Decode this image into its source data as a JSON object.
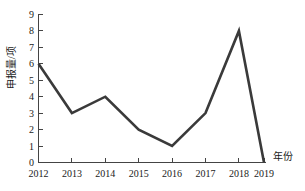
{
  "chart_data": {
    "type": "line",
    "title": "",
    "xlabel": "年份",
    "ylabel": "申报量/项",
    "categories": [
      "2012",
      "2013",
      "2014",
      "2015",
      "2016",
      "2017",
      "2018",
      "2019"
    ],
    "values": [
      6,
      3,
      4,
      2,
      1,
      3,
      8,
      0
    ],
    "series": [
      {
        "name": "申报量",
        "values": [
          6,
          3,
          4,
          2,
          1,
          3,
          8,
          0
        ],
        "color": "#3a3a3a"
      }
    ],
    "x": [
      2012,
      2013,
      2014,
      2015,
      2016,
      2017,
      2018,
      2019
    ],
    "ylim": [
      0,
      9
    ],
    "ytick_labels": [
      "0",
      "1",
      "2",
      "3",
      "4",
      "5",
      "6",
      "7",
      "8",
      "9"
    ],
    "ytick_values": [
      0,
      1,
      2,
      3,
      4,
      5,
      6,
      7,
      8,
      9
    ],
    "xtick_labels": [
      "2012",
      "2013",
      "2014",
      "2015",
      "2016",
      "2017",
      "2018",
      "2019"
    ],
    "grid": false,
    "legend": false,
    "legend_position": "none",
    "line_color": "#3a3a3a",
    "axis_color": "#444444",
    "background_color": "#ffffff"
  },
  "axes": {
    "y_title": "申报量/项",
    "x_title": "年份"
  }
}
